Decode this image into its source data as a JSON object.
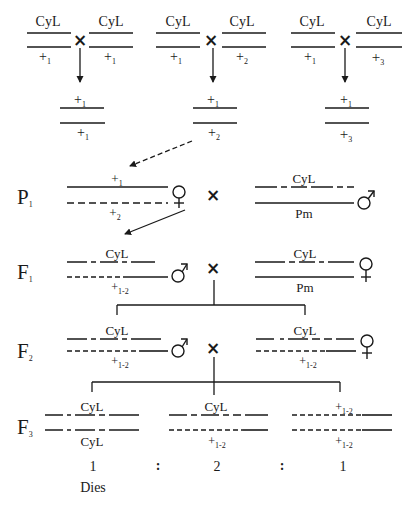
{
  "figure": {
    "type": "genetic crossing scheme",
    "colors": {
      "ink": "#1a1a1a",
      "background": "#ffffff"
    }
  },
  "top_crosses": [
    {
      "left": {
        "upper": "CyL",
        "lower": "+",
        "lower_sub": "1"
      },
      "cross": "×",
      "right": {
        "upper": "CyL",
        "lower": "+",
        "lower_sub": "1"
      },
      "offspring": {
        "upper": "+",
        "upper_sub": "1",
        "lower": "+",
        "lower_sub": "1"
      }
    },
    {
      "left": {
        "upper": "CyL",
        "lower": "+",
        "lower_sub": "1"
      },
      "cross": "×",
      "right": {
        "upper": "CyL",
        "lower": "+",
        "lower_sub": "2"
      },
      "offspring": {
        "upper": "+",
        "upper_sub": "1",
        "lower": "+",
        "lower_sub": "2"
      }
    },
    {
      "left": {
        "upper": "CyL",
        "lower": "+",
        "lower_sub": "1"
      },
      "cross": "×",
      "right": {
        "upper": "CyL",
        "lower": "+",
        "lower_sub": "3"
      },
      "offspring": {
        "upper": "+",
        "upper_sub": "1",
        "lower": "+",
        "lower_sub": "3"
      }
    }
  ],
  "generations": {
    "P1": {
      "label": "P",
      "label_sub": "1",
      "female": {
        "upper": "+",
        "upper_sub": "1",
        "lower": "+",
        "lower_sub": "2",
        "sex": "♀"
      },
      "cross": "×",
      "male": {
        "upper": "CyL",
        "lower": "Pm",
        "sex": "♂"
      }
    },
    "F1": {
      "label": "F",
      "label_sub": "1",
      "left": {
        "upper": "CyL",
        "lower": "+",
        "lower_sub": "1-2",
        "sex": "♂"
      },
      "cross": "×",
      "right": {
        "upper": "CyL",
        "lower": "Pm",
        "sex": "♀"
      }
    },
    "F2": {
      "label": "F",
      "label_sub": "2",
      "left": {
        "upper": "CyL",
        "lower": "+",
        "lower_sub": "1-2",
        "sex": "♂"
      },
      "cross": "×",
      "right": {
        "upper": "CyL",
        "lower": "+",
        "lower_sub": "1-2",
        "sex": "♀"
      }
    },
    "F3": {
      "label": "F",
      "label_sub": "3",
      "genotypes": [
        {
          "upper": "CyL",
          "upper_sub": "",
          "lower": "CyL",
          "lower_sub": "",
          "ratio": "1",
          "note": "Dies"
        },
        {
          "upper": "CyL",
          "upper_sub": "",
          "lower": "+",
          "lower_sub": "1-2",
          "ratio": "2",
          "note": ""
        },
        {
          "upper": "+",
          "upper_sub": "1-2",
          "lower": "+",
          "lower_sub": "1-2",
          "ratio": "1",
          "note": ""
        }
      ],
      "separator": ":"
    }
  }
}
